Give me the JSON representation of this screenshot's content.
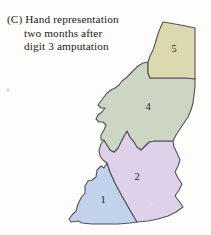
{
  "figure": {
    "panel_label": "(C)",
    "caption_lines": [
      "Hand representation",
      "two months after",
      "digit 3 amputation"
    ],
    "caption_full": "(C) Hand representation two months after digit 3 amputation",
    "background_color": "#fdfdfc",
    "outline_color": "#55515a",
    "width": 211,
    "height": 235
  },
  "chart_data": {
    "type": "map",
    "subtitle": "",
    "xlabel": "",
    "ylabel": "",
    "grid": false,
    "legend_position": "none",
    "categories": [
      "1",
      "2",
      "4",
      "5"
    ],
    "values": [
      1,
      2,
      4,
      5
    ],
    "missing_categories": [
      "3"
    ],
    "regions": [
      {
        "id": "region-1",
        "label": "1",
        "name": "digit-1",
        "fill": "#c3d2ec",
        "label_x": 103,
        "label_y": 201,
        "path": "M 107 163 L 104 168 L 101 166 L 97 170 L 96 177 L 92 180 L 88 181 L 85 186 L 85 193 L 81 198 L 78 204 L 76 211 L 72 215 L 69 219 L 71 222 L 78 221 L 82 223 L 92 224 L 104 224 L 118 224 L 130 223 L 137 222 L 130 210 L 122 196 L 115 183 L 110 172 Z"
      },
      {
        "id": "region-2",
        "label": "2",
        "name": "digit-2",
        "fill": "#ddd2e9",
        "label_x": 137,
        "label_y": 178,
        "path": "M 107 163 L 110 172 L 115 183 L 122 196 L 130 210 L 137 222 L 148 221 L 158 219 L 168 216 L 176 212 L 183 207 L 179 201 L 175 196 L 179 190 L 182 184 L 178 178 L 175 172 L 178 166 L 180 160 L 177 153 L 174 147 L 173 141 L 164 141 L 155 141 L 149 142 L 145 146 L 141 150 L 137 147 L 134 142 L 130 137 L 127 131 L 124 136 L 121 142 L 118 148 L 114 152 L 110 150 L 107 145 L 104 140 L 101 144 L 99 150 L 100 156 L 103 160 Z"
      },
      {
        "id": "region-4",
        "label": "4",
        "name": "digit-4",
        "fill": "#ccd6c2",
        "label_x": 148,
        "label_y": 108,
        "path": "M 148 62 L 143 63 L 138 66 L 134 70 L 130 74 L 126 78 L 122 81 L 119 85 L 115 88 L 111 90 L 107 93 L 104 97 L 101 101 L 98 105 L 101 108 L 105 108 L 102 112 L 98 115 L 96 119 L 99 122 L 103 122 L 106 125 L 104 130 L 101 135 L 101 140 L 104 140 L 107 145 L 110 150 L 114 152 L 118 148 L 121 142 L 124 136 L 127 131 L 130 137 L 134 142 L 137 147 L 141 150 L 145 146 L 149 142 L 155 141 L 164 141 L 173 141 L 176 135 L 180 129 L 184 123 L 188 117 L 191 110 L 193 103 L 194 95 L 195 87 L 195 79 L 190 78 L 180 78 L 170 78 L 160 78 L 150 78 L 148 73 Z"
      },
      {
        "id": "region-5",
        "label": "5",
        "name": "digit-5",
        "fill": "#dcd9b0",
        "label_x": 174,
        "label_y": 50,
        "path": "M 163 22 L 175 24 L 186 26 L 195 28 L 195 38 L 195 48 L 195 58 L 195 68 L 195 79 L 185 78 L 175 78 L 165 78 L 155 78 L 150 78 L 148 73 L 148 62 L 150 56 L 153 50 L 155 44 L 157 37 L 159 31 Z"
      }
    ]
  }
}
